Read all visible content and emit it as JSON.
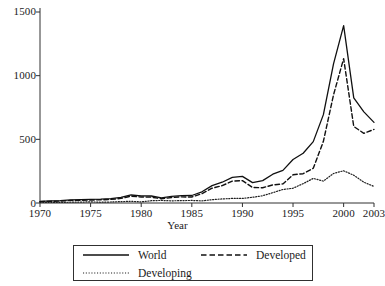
{
  "chart_data": {
    "type": "line",
    "title": "",
    "xlabel": "Year",
    "ylabel": "",
    "xlim": [
      1970,
      2003
    ],
    "ylim": [
      0,
      1500
    ],
    "grid": false,
    "legend_position": "bottom",
    "xticks": [
      1970,
      1975,
      1980,
      1985,
      1990,
      1995,
      2000,
      2003
    ],
    "yticks": [
      0,
      500,
      1000,
      1500
    ],
    "x": [
      1970,
      1971,
      1972,
      1973,
      1974,
      1975,
      1976,
      1977,
      1978,
      1979,
      1980,
      1981,
      1982,
      1983,
      1984,
      1985,
      1986,
      1987,
      1988,
      1989,
      1990,
      1991,
      1992,
      1993,
      1994,
      1995,
      1996,
      1997,
      1998,
      1999,
      2000,
      2001,
      2002,
      2003
    ],
    "series": [
      {
        "name": "World",
        "style": "solid",
        "color": "#101010",
        "values": [
          13,
          16,
          19,
          24,
          26,
          28,
          30,
          34,
          44,
          63,
          56,
          55,
          40,
          52,
          58,
          59,
          88,
          136,
          163,
          201,
          209,
          160,
          176,
          226,
          256,
          342,
          391,
          482,
          694,
          1092,
          1393,
          826,
          716,
          633
        ]
      },
      {
        "name": "Developed",
        "style": "dashed",
        "color": "#101010",
        "values": [
          10,
          13,
          15,
          20,
          21,
          23,
          25,
          28,
          36,
          54,
          47,
          46,
          33,
          43,
          48,
          47,
          73,
          116,
          136,
          172,
          176,
          122,
          120,
          142,
          150,
          222,
          230,
          273,
          484,
          849,
          1134,
          601,
          547,
          578
        ]
      },
      {
        "name": "Developing",
        "style": "dotted",
        "color": "#202020",
        "values": [
          4,
          4,
          5,
          6,
          7,
          9,
          6,
          8,
          11,
          13,
          9,
          18,
          20,
          17,
          19,
          20,
          17,
          26,
          32,
          36,
          36,
          45,
          57,
          81,
          106,
          116,
          152,
          193,
          172,
          232,
          253,
          218,
          163,
          130
        ]
      }
    ]
  },
  "axis": {
    "x_title": "Year",
    "ytick_labels": [
      "1500",
      "1000",
      "500",
      "0"
    ],
    "xtick_labels": [
      "1970",
      "1975",
      "1980",
      "1985",
      "1990",
      "1995",
      "2000",
      "2003"
    ]
  },
  "legend": {
    "entries": [
      {
        "label": "World",
        "style": "solid"
      },
      {
        "label": "Developed",
        "style": "dashed"
      },
      {
        "label": "Developing",
        "style": "dotted"
      }
    ]
  }
}
